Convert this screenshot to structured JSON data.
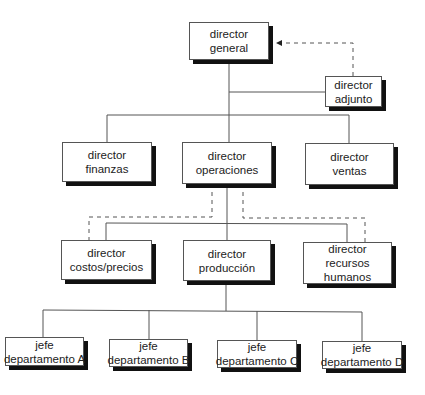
{
  "chart": {
    "title": "",
    "nodes": [
      {
        "id": "director-general",
        "lines": [
          "director",
          "general"
        ],
        "box": [
          189,
          22,
          80,
          38
        ]
      },
      {
        "id": "director-adjunto",
        "lines": [
          "director",
          "adjunto"
        ],
        "box": [
          325,
          76,
          57,
          31
        ]
      },
      {
        "id": "director-finanzas",
        "lines": [
          "director",
          "finanzas"
        ],
        "box": [
          62,
          142,
          90,
          40
        ]
      },
      {
        "id": "director-operaciones",
        "lines": [
          "director",
          "operaciones"
        ],
        "box": [
          182,
          142,
          90,
          42
        ]
      },
      {
        "id": "director-ventas",
        "lines": [
          "director",
          "ventas"
        ],
        "box": [
          305,
          143,
          89,
          42
        ]
      },
      {
        "id": "director-costos-precios",
        "lines": [
          "director",
          "costos/precios"
        ],
        "box": [
          61,
          240,
          91,
          40
        ]
      },
      {
        "id": "director-produccion",
        "lines": [
          "director",
          "producción"
        ],
        "box": [
          183,
          240,
          88,
          41
        ]
      },
      {
        "id": "director-recursos-humanos",
        "lines": [
          "director",
          "recursos",
          "humanos"
        ],
        "box": [
          303,
          242,
          89,
          42
        ]
      },
      {
        "id": "jefe-departamento-a",
        "lines": [
          "jefe",
          "departamento A"
        ],
        "box": [
          5,
          337,
          79,
          29
        ]
      },
      {
        "id": "jefe-departamento-b",
        "lines": [
          "jefe",
          "departamento B"
        ],
        "box": [
          109,
          339,
          79,
          28
        ]
      },
      {
        "id": "jefe-departamento-c",
        "lines": [
          "jefe",
          "departamento C"
        ],
        "box": [
          217,
          340,
          80,
          28
        ]
      },
      {
        "id": "jefe-departamento-d",
        "lines": [
          "jefe",
          "departamento D"
        ],
        "box": [
          322,
          341,
          80,
          28
        ]
      }
    ],
    "solid_edges": [
      {
        "from": "director-general",
        "to": "director-adjunto"
      },
      {
        "from": "director-general",
        "to": "director-finanzas"
      },
      {
        "from": "director-general",
        "to": "director-operaciones"
      },
      {
        "from": "director-general",
        "to": "director-ventas"
      },
      {
        "from": "director-operaciones",
        "to": "director-costos-precios"
      },
      {
        "from": "director-operaciones",
        "to": "director-produccion"
      },
      {
        "from": "director-operaciones",
        "to": "director-recursos-humanos"
      },
      {
        "from": "director-produccion",
        "to": "jefe-departamento-a"
      },
      {
        "from": "director-produccion",
        "to": "jefe-departamento-b"
      },
      {
        "from": "director-produccion",
        "to": "jefe-departamento-c"
      },
      {
        "from": "director-produccion",
        "to": "jefe-departamento-d"
      }
    ],
    "dashed_edges": [
      {
        "from": "director-adjunto",
        "to": "director-general",
        "arrow": true
      },
      {
        "from": "director-operaciones",
        "to": "director-costos-precios",
        "arrow": false
      },
      {
        "from": "director-operaciones",
        "to": "director-recursos-humanos",
        "arrow": false
      }
    ]
  },
  "colors": {
    "line": "#555555",
    "shadow": "#111111",
    "text": "#222222",
    "background": "#ffffff"
  }
}
